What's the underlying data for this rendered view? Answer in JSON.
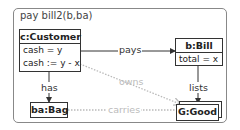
{
  "frame": {
    "title": "pay bill2(b,ba)"
  },
  "objects": {
    "customer": {
      "name": "c:Customer",
      "attributes": [
        "cash = y",
        "cash := y - x"
      ]
    },
    "bill": {
      "name": "b:Bill",
      "attributes": [
        "total = x"
      ]
    },
    "bag": {
      "name": "ba:Bag"
    },
    "good": {
      "name": "G:Good",
      "multi": true
    }
  },
  "links": {
    "pays": "pays",
    "has": "has",
    "lists": "lists",
    "owns": "owns",
    "carries": "carries"
  },
  "colors": {
    "line": "#333333",
    "faint": "#bbbbbb",
    "frame": "#888888"
  }
}
